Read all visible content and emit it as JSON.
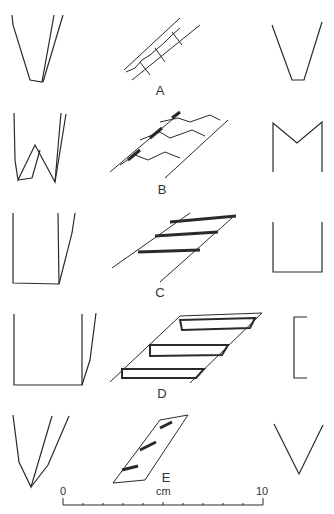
{
  "figure": {
    "rows": [
      {
        "label": "A",
        "profile_shape": "narrow-v-flat-bottom"
      },
      {
        "label": "B",
        "profile_shape": "w-double-groove"
      },
      {
        "label": "C",
        "profile_shape": "u-flat-bottom"
      },
      {
        "label": "D",
        "profile_shape": "wide-flat-bracket"
      },
      {
        "label": "E",
        "profile_shape": "v-pointed"
      }
    ],
    "scale_bar": {
      "start_label": "0",
      "unit_label": "cm",
      "end_label": "10"
    }
  }
}
